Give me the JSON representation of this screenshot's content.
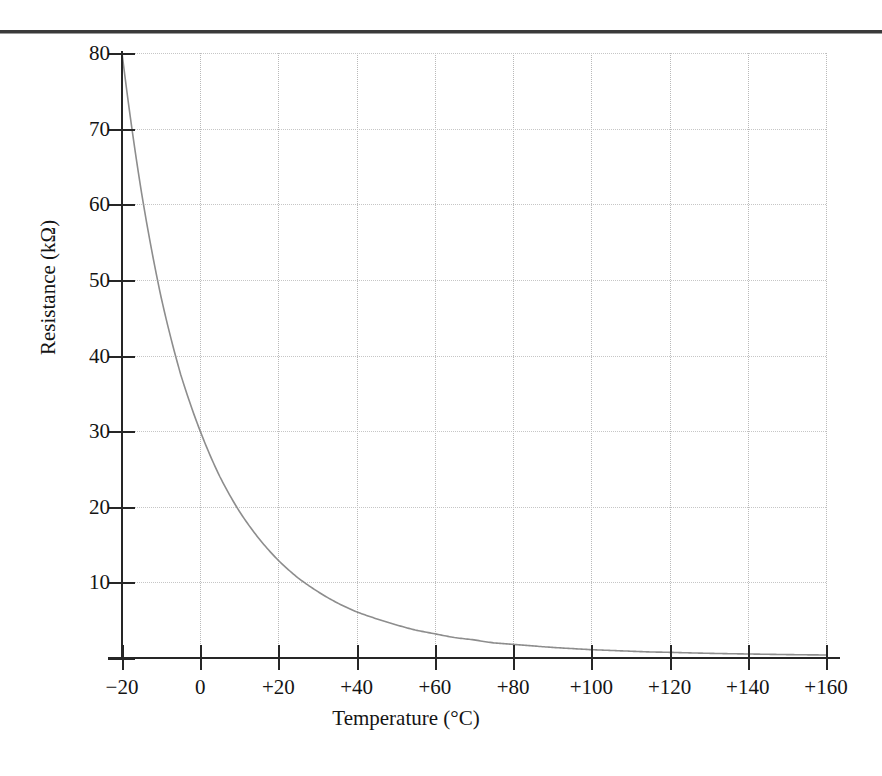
{
  "figure": {
    "top_rule": "page-rule",
    "background_color": "#ffffff",
    "curve_color": "#8d8d8d",
    "axis_color": "#262626",
    "grid_color": "#c2c2c2"
  },
  "chart_data": {
    "type": "line",
    "title": "",
    "subtitle": "",
    "xlabel": "Temperature (°C)",
    "ylabel": "Resistance (kΩ)",
    "xlim": [
      -20,
      160
    ],
    "ylim": [
      0,
      80
    ],
    "xticks": [
      -20,
      0,
      20,
      40,
      60,
      80,
      100,
      120,
      140,
      160
    ],
    "xticklabels": [
      "−20",
      "0",
      "+20",
      "+40",
      "+60",
      "+80",
      "+100",
      "+120",
      "+140",
      "+160"
    ],
    "yticks": [
      0,
      10,
      20,
      30,
      40,
      50,
      60,
      70,
      80
    ],
    "yticklabels": [
      "",
      "10",
      "20",
      "30",
      "40",
      "50",
      "60",
      "70",
      "80"
    ],
    "grid": true,
    "grid_style": "dotted",
    "legend": null,
    "legend_position": "none",
    "series": [
      {
        "name": "NTC thermistor resistance",
        "x": [
          -20,
          -15,
          -10,
          -5,
          0,
          5,
          10,
          15,
          20,
          25,
          30,
          35,
          40,
          45,
          50,
          55,
          60,
          65,
          70,
          75,
          80,
          85,
          90,
          95,
          100,
          105,
          110,
          115,
          120,
          125,
          130,
          135,
          140,
          145,
          150,
          155,
          160
        ],
        "y": [
          80.0,
          61.5,
          47.7,
          37.5,
          30.0,
          24.0,
          19.4,
          15.8,
          12.9,
          10.6,
          8.8,
          7.3,
          6.1,
          5.2,
          4.4,
          3.7,
          3.2,
          2.7,
          2.4,
          2.0,
          1.8,
          1.6,
          1.4,
          1.25,
          1.1,
          1.0,
          0.9,
          0.8,
          0.75,
          0.68,
          0.62,
          0.57,
          0.53,
          0.49,
          0.45,
          0.42,
          0.4
        ]
      }
    ]
  },
  "axes": {
    "x": {
      "ticks": [
        {
          "value": -20,
          "label": "−20"
        },
        {
          "value": 0,
          "label": "0"
        },
        {
          "value": 20,
          "label": "+20"
        },
        {
          "value": 40,
          "label": "+40"
        },
        {
          "value": 60,
          "label": "+60"
        },
        {
          "value": 80,
          "label": "+80"
        },
        {
          "value": 100,
          "label": "+100"
        },
        {
          "value": 120,
          "label": "+120"
        },
        {
          "value": 140,
          "label": "+140"
        },
        {
          "value": 160,
          "label": "+160"
        }
      ],
      "title": "Temperature (°C)"
    },
    "y": {
      "ticks": [
        {
          "value": 0,
          "label": ""
        },
        {
          "value": 10,
          "label": "10"
        },
        {
          "value": 20,
          "label": "20"
        },
        {
          "value": 30,
          "label": "30"
        },
        {
          "value": 40,
          "label": "40"
        },
        {
          "value": 50,
          "label": "50"
        },
        {
          "value": 60,
          "label": "60"
        },
        {
          "value": 70,
          "label": "70"
        },
        {
          "value": 80,
          "label": "80"
        }
      ],
      "title": "Resistance (kΩ)"
    }
  }
}
